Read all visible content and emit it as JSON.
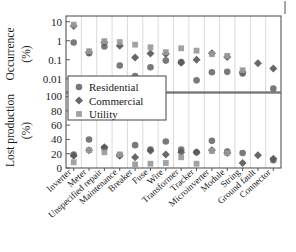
{
  "chart_data": {
    "type": "scatter",
    "title": "",
    "categories": [
      "Inverter",
      "Meter",
      "Unspecified repair",
      "Maintenance",
      "Breaker",
      "Fuse",
      "Wire",
      "Transformer",
      "Tracker",
      "Microinverter",
      "Module",
      "String",
      "Ground fault",
      "Connector"
    ],
    "panels": [
      {
        "id": "occurrence",
        "ylabel": "Occurrence",
        "yunit": "(%)",
        "yscale": "log",
        "ylim": [
          0.002,
          20
        ],
        "yticks": [
          10,
          1,
          0.1,
          0.01
        ],
        "yticklabels": [
          "10",
          "1",
          "0.1",
          "0.01"
        ],
        "grid": "vertical",
        "series": [
          {
            "name": "Residential",
            "marker": "circle",
            "color": "#6e6e6e",
            "values": [
              0.8,
              0.22,
              0.5,
              0.05,
              0.014,
              0.04,
              0.09,
              0.075,
              0.0082,
              0.022,
              0.023,
              0.019,
              null,
              0.003
            ]
          },
          {
            "name": "Commercial",
            "marker": "diamond",
            "color": "#5a5a5a",
            "values": [
              6.0,
              0.25,
              0.8,
              0.55,
              0.13,
              0.21,
              0.2,
              0.07,
              0.1,
              0.22,
              0.14,
              0.022,
              0.065,
              0.035
            ]
          },
          {
            "name": "Utility",
            "marker": "square",
            "color": "#9a9a9a",
            "values": [
              7.0,
              0.28,
              0.95,
              0.85,
              0.62,
              0.45,
              0.25,
              0.4,
              0.3,
              0.2,
              0.16,
              0.028,
              null,
              null
            ]
          }
        ]
      },
      {
        "id": "lost-production",
        "ylabel": "Lost production",
        "yunit": "(%)",
        "yscale": "linear",
        "ylim": [
          0,
          105
        ],
        "yticks": [
          100,
          80,
          60,
          40,
          20,
          0
        ],
        "yticklabels": [
          "100",
          "80",
          "60",
          "40",
          "20",
          "0"
        ],
        "grid": "vertical",
        "series": [
          {
            "name": "Residential",
            "marker": "circle",
            "color": "#6e6e6e",
            "values": [
              19,
              40,
              28,
              18,
              32,
              26,
              37,
              26,
              22,
              38,
              23,
              21,
              null,
              11
            ]
          },
          {
            "name": "Commercial",
            "marker": "diamond",
            "color": "#5a5a5a",
            "values": [
              17,
              25,
              29,
              17,
              15,
              24,
              19,
              22,
              22,
              25,
              21,
              7,
              18,
              13
            ]
          },
          {
            "name": "Utility",
            "marker": "square",
            "color": "#9a9a9a",
            "values": [
              8,
              25,
              22,
              19,
              5,
              6,
              7,
              15,
              6,
              24,
              21,
              null,
              null,
              null
            ]
          }
        ]
      }
    ],
    "legend": {
      "position": "middle-left",
      "entries": [
        {
          "label": "Residential",
          "marker": "circle",
          "color": "#6e6e6e"
        },
        {
          "label": "Commercial",
          "marker": "diamond",
          "color": "#5a5a5a"
        },
        {
          "label": "Utility",
          "marker": "square",
          "color": "#9a9a9a"
        }
      ]
    }
  }
}
